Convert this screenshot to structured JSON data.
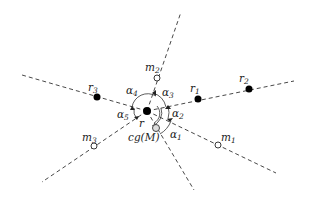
{
  "diagram": {
    "center": {
      "id": "r",
      "label": "r",
      "x": 147,
      "y": 111
    },
    "centroid": {
      "id": "cg",
      "label": "cg(M)",
      "x": 156,
      "y": 128
    },
    "points": [
      {
        "id": "r1",
        "base": "r",
        "sub": "1",
        "type": "robot",
        "x": 198,
        "y": 99
      },
      {
        "id": "r2",
        "base": "r",
        "sub": "2",
        "type": "robot",
        "x": 249,
        "y": 89
      },
      {
        "id": "r3",
        "base": "r",
        "sub": "3",
        "type": "robot",
        "x": 97,
        "y": 97
      },
      {
        "id": "m1",
        "base": "m",
        "sub": "1",
        "type": "marker",
        "x": 218,
        "y": 145
      },
      {
        "id": "m2",
        "base": "m",
        "sub": "2",
        "type": "marker",
        "x": 157,
        "y": 78
      },
      {
        "id": "m3",
        "base": "m",
        "sub": "3",
        "type": "marker",
        "x": 94,
        "y": 146
      }
    ],
    "angles": [
      {
        "id": "alpha1",
        "base": "α",
        "sub": "1"
      },
      {
        "id": "alpha2",
        "base": "α",
        "sub": "2"
      },
      {
        "id": "alpha3",
        "base": "α",
        "sub": "3"
      },
      {
        "id": "alpha4",
        "base": "α",
        "sub": "4"
      },
      {
        "id": "alpha5",
        "base": "α",
        "sub": "5"
      }
    ],
    "legend": {
      "filled_dot": "robot",
      "open_dot": "marker"
    }
  }
}
